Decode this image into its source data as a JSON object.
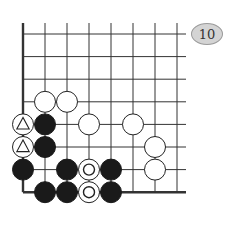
{
  "diagram": {
    "type": "go-board-fragment",
    "problem_number": "10",
    "grid": {
      "columns": 8,
      "rows": 8,
      "origin_x": 23,
      "origin_y": 34,
      "spacing_x": 22,
      "spacing_y": 22.6,
      "thick_edges": [
        "left",
        "bottom"
      ],
      "line_color": "#333333"
    },
    "stones": [
      {
        "col": 1,
        "row": 3,
        "color": "white",
        "mark": "none"
      },
      {
        "col": 2,
        "row": 3,
        "color": "white",
        "mark": "none"
      },
      {
        "col": 0,
        "row": 4,
        "color": "white",
        "mark": "triangle"
      },
      {
        "col": 1,
        "row": 4,
        "color": "black",
        "mark": "none"
      },
      {
        "col": 3,
        "row": 4,
        "color": "white",
        "mark": "none"
      },
      {
        "col": 5,
        "row": 4,
        "color": "white",
        "mark": "none"
      },
      {
        "col": 0,
        "row": 5,
        "color": "white",
        "mark": "triangle"
      },
      {
        "col": 1,
        "row": 5,
        "color": "black",
        "mark": "none"
      },
      {
        "col": 6,
        "row": 5,
        "color": "white",
        "mark": "none"
      },
      {
        "col": 0,
        "row": 6,
        "color": "black",
        "mark": "none"
      },
      {
        "col": 2,
        "row": 6,
        "color": "black",
        "mark": "none"
      },
      {
        "col": 3,
        "row": 6,
        "color": "white",
        "mark": "circle"
      },
      {
        "col": 4,
        "row": 6,
        "color": "black",
        "mark": "none"
      },
      {
        "col": 6,
        "row": 6,
        "color": "white",
        "mark": "none"
      },
      {
        "col": 1,
        "row": 7,
        "color": "black",
        "mark": "none"
      },
      {
        "col": 2,
        "row": 7,
        "color": "black",
        "mark": "none"
      },
      {
        "col": 3,
        "row": 7,
        "color": "white",
        "mark": "circle"
      },
      {
        "col": 4,
        "row": 7,
        "color": "black",
        "mark": "none"
      }
    ]
  }
}
